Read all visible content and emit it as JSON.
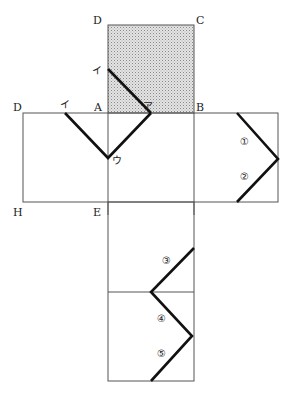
{
  "diagram": {
    "colors": {
      "stroke": "#555555",
      "path": "#111111",
      "shade": "#c8c8c8",
      "background": "#ffffff"
    },
    "vertex_labels": {
      "top_D": "D",
      "top_C": "C",
      "left_D": "D",
      "A": "A",
      "B": "B",
      "H": "H",
      "E": "E"
    },
    "point_labels": {
      "i_top": "イ",
      "i_left": "イ",
      "a": "ア",
      "u": "ウ"
    },
    "segment_labels": [
      "①",
      "②",
      "③",
      "④",
      "⑤"
    ],
    "faces": [
      {
        "name": "top-face-shaded",
        "shaded": true
      },
      {
        "name": "middle-left-face"
      },
      {
        "name": "middle-center-face"
      },
      {
        "name": "middle-right-face"
      },
      {
        "name": "lower-face-1"
      },
      {
        "name": "lower-face-2"
      }
    ]
  }
}
